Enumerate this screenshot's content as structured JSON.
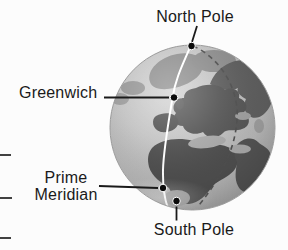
{
  "labels": {
    "north_pole": "North Pole",
    "greenwich": "Greenwich",
    "prime_meridian": "Prime Meridian",
    "south_pole": "South Pole"
  },
  "colors": {
    "background": "#fcfcfc",
    "ocean": "#bdbdbd",
    "land_dark": "#525252",
    "land_light": "#8d8d8d",
    "prime_meridian_line": "#ffffff",
    "east_meridian_dashed": "#4f4f4f",
    "marker_dot": "#0b0b0b",
    "leader_line": "#1a1a1a",
    "label_text": "#1a1a1a"
  }
}
